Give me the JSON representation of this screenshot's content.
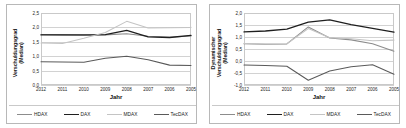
{
  "figure": {
    "panels": [
      {
        "id": "left",
        "ylabel": "Verschuldungsgrad\n(Median)",
        "ylabel_line1": "Verschuldungsgrad",
        "ylabel_line2": "(Median)",
        "xlabel": "Jahr"
      },
      {
        "id": "right",
        "ylabel_line1": "Dynamischer",
        "ylabel_line2": "Verschuldungsgrad",
        "ylabel_line3": "(Median)",
        "xlabel": "Jahr"
      }
    ],
    "legend": [
      {
        "label": "HDAX",
        "color": "#8c8c8c"
      },
      {
        "label": "DAX",
        "color": "#1f1f1f"
      },
      {
        "label": "MDAX",
        "color": "#c4c4c4"
      },
      {
        "label": "TecDAX",
        "color": "#5a5a5a"
      }
    ]
  },
  "chart_data": [
    {
      "type": "line",
      "title": "",
      "xlabel": "Jahr",
      "ylabel": "Verschuldungsgrad (Median)",
      "categories": [
        "2012",
        "2011",
        "2010",
        "2009",
        "2008",
        "2007",
        "2006",
        "2005"
      ],
      "ylim": [
        0.0,
        2.5
      ],
      "ytick_labels": [
        "0,0",
        "0,5",
        "1,0",
        "1,5",
        "2,0",
        "2,5"
      ],
      "yticks": [
        0.0,
        0.5,
        1.0,
        1.5,
        2.0,
        2.5
      ],
      "grid": true,
      "legend_position": "bottom",
      "series": [
        {
          "name": "HDAX",
          "color": "#8c8c8c",
          "values": [
            1.75,
            1.74,
            1.73,
            1.74,
            1.78,
            1.69,
            1.66,
            1.7
          ]
        },
        {
          "name": "DAX",
          "color": "#1f1f1f",
          "values": [
            1.74,
            1.74,
            1.74,
            1.75,
            1.9,
            1.67,
            1.65,
            1.72
          ]
        },
        {
          "name": "MDAX",
          "color": "#c4c4c4",
          "values": [
            1.46,
            1.44,
            1.62,
            1.82,
            2.21,
            1.98,
            1.99,
            2.0
          ]
        },
        {
          "name": "TecDAX",
          "color": "#5a5a5a",
          "values": [
            0.81,
            0.8,
            0.79,
            0.93,
            1.0,
            0.88,
            0.69,
            0.68
          ]
        }
      ]
    },
    {
      "type": "line",
      "title": "",
      "xlabel": "Jahr",
      "ylabel": "Dynamischer Verschuldungsgrad (Median)",
      "categories": [
        "2012",
        "2011",
        "2010",
        "2009",
        "2008",
        "2007",
        "2006",
        "2005"
      ],
      "ylim": [
        -1.0,
        2.0
      ],
      "ytick_labels": [
        "-1,0",
        "-0,5",
        "0,0",
        "0,5",
        "1,0",
        "1,5",
        "2,0"
      ],
      "yticks": [
        -1.0,
        -0.5,
        0.0,
        0.5,
        1.0,
        1.5,
        2.0
      ],
      "grid": true,
      "legend_position": "bottom",
      "series": [
        {
          "name": "HDAX",
          "color": "#8c8c8c",
          "values": [
            0.72,
            0.7,
            0.71,
            1.42,
            0.96,
            0.88,
            0.72,
            0.41
          ]
        },
        {
          "name": "DAX",
          "color": "#1f1f1f",
          "values": [
            1.21,
            1.25,
            1.33,
            1.62,
            1.71,
            1.52,
            1.36,
            1.2
          ]
        },
        {
          "name": "MDAX",
          "color": "#c4c4c4",
          "values": [
            0.73,
            0.71,
            0.72,
            1.35,
            0.97,
            0.93,
            0.84,
            0.87
          ]
        },
        {
          "name": "TecDAX",
          "color": "#5a5a5a",
          "values": [
            -0.17,
            -0.19,
            -0.22,
            -0.8,
            -0.42,
            -0.24,
            -0.16,
            -0.55
          ]
        }
      ]
    }
  ]
}
